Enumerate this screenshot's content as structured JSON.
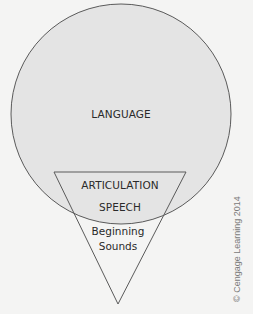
{
  "diagram": {
    "colors": {
      "background": "#f4f4f3",
      "circle_fill": "#e4e4e4",
      "stroke": "#5a5a5a",
      "text": "#2a2a2a",
      "credit_text": "#7a7a7a"
    },
    "labels": {
      "language": "LANGUAGE",
      "articulation": "ARTICULATION",
      "speech": "SPEECH",
      "beginning_line1": "Beginning",
      "beginning_line2": "Sounds"
    },
    "credit": "© Cengage Learning 2014"
  }
}
